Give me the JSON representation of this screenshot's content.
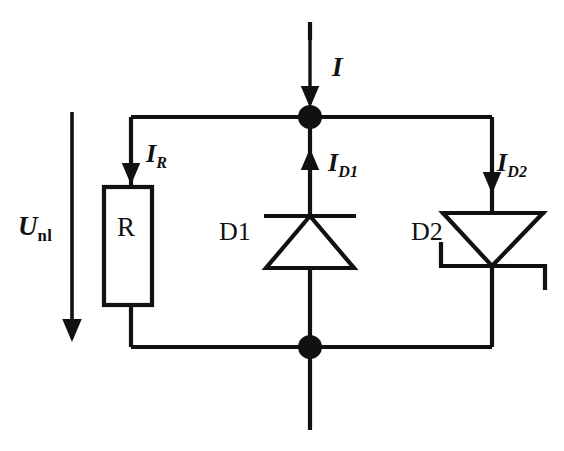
{
  "figure": {
    "background_color": "#ffffff",
    "line_color": "#111111"
  },
  "labels": {
    "voltage": {
      "symbol": "U",
      "subscript": "nl",
      "name": "source-voltage"
    },
    "current_total": {
      "symbol": "I",
      "subscript": "",
      "name": "total-current"
    },
    "current_resistor": {
      "symbol": "I",
      "subscript": "R",
      "name": "resistor-current"
    },
    "current_diode1": {
      "symbol": "I",
      "subscript": "D1",
      "name": "diode1-current"
    },
    "current_diode2": {
      "symbol": "I",
      "subscript": "D2",
      "name": "diode2-current"
    },
    "resistor": "R",
    "diode1": "D1",
    "diode2": "D2"
  },
  "components": [
    {
      "ref": "R",
      "type": "resistor",
      "label": "R",
      "branch": "left",
      "current_label": "I_R",
      "current_direction": "down"
    },
    {
      "ref": "D1",
      "type": "diode",
      "label": "D1",
      "branch": "middle",
      "orientation": "cathode-up",
      "current_label": "I_D1",
      "current_direction": "up"
    },
    {
      "ref": "D2",
      "type": "zener-diode",
      "label": "D2",
      "branch": "right",
      "orientation": "cathode-down",
      "current_label": "I_D2",
      "current_direction": "down"
    }
  ],
  "nodes": [
    {
      "name": "top-node",
      "x": 310,
      "y": 117
    },
    {
      "name": "bottom-node",
      "x": 310,
      "y": 347
    }
  ],
  "rails": {
    "top_y": 117,
    "bottom_y": 347,
    "left_x": 131,
    "right_x": 492
  }
}
